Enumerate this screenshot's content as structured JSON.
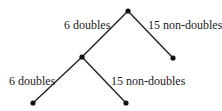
{
  "diagram": {
    "type": "tree",
    "nodes": [
      {
        "id": "root",
        "x": 128,
        "y": 11
      },
      {
        "id": "mid",
        "x": 82,
        "y": 57
      },
      {
        "id": "leaf-right",
        "x": 173,
        "y": 58
      },
      {
        "id": "leaf-bottom-left",
        "x": 33,
        "y": 103
      },
      {
        "id": "leaf-bottom-right",
        "x": 126,
        "y": 103
      }
    ],
    "edges": [
      {
        "from": "root",
        "to": "mid",
        "label": "6 doubles"
      },
      {
        "from": "root",
        "to": "leaf-right",
        "label": "15 non-doubles"
      },
      {
        "from": "mid",
        "to": "leaf-bottom-left",
        "label": "6 doubles"
      },
      {
        "from": "mid",
        "to": "leaf-bottom-right",
        "label": "15 non-doubles"
      }
    ]
  },
  "labels": {
    "top_left": "6 doubles",
    "top_right": "15 non-doubles",
    "bottom_left": "6 doubles",
    "bottom_right": "15 non-doubles"
  },
  "colors": {
    "line": "#222222",
    "node": "#111111",
    "text": "#222222"
  }
}
